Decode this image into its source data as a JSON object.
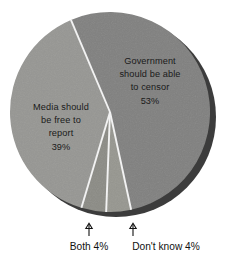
{
  "chart_data": {
    "type": "pie",
    "title": "",
    "subtitle": "",
    "xlabel": "",
    "ylabel": "",
    "legend_position": "none",
    "grid": false,
    "total": 100,
    "unit": "%",
    "categories": [
      "Government should be able to censor",
      "Don't know",
      "Both",
      "Media should be free to report"
    ],
    "values": [
      53,
      4,
      4,
      39
    ],
    "slices": [
      {
        "id": "government",
        "label_lines": [
          "Government",
          "should be able",
          "to censor"
        ],
        "value_label": "53%",
        "value": 53,
        "color": "#80807f",
        "start_angle_deg": -23,
        "end_angle_deg": 167.8,
        "label_placement": "inside",
        "label_x": 150,
        "label_y": 66
      },
      {
        "id": "dont-know",
        "label_lines": [
          "Don't know"
        ],
        "value_label": "4%",
        "value": 4,
        "color": "#96968f",
        "start_angle_deg": 167.8,
        "end_angle_deg": 182.2,
        "label_placement": "callout-bottom",
        "label_x": 167,
        "label_y": 246
      },
      {
        "id": "both",
        "label_lines": [
          "Both"
        ],
        "value_label": "4%",
        "value": 4,
        "color": "#8b8b85",
        "start_angle_deg": 182.2,
        "end_angle_deg": 196.6,
        "label_placement": "callout-bottom",
        "label_x": 89,
        "label_y": 246
      },
      {
        "id": "media",
        "label_lines": [
          "Media should",
          "be free to",
          "report"
        ],
        "value_label": "39%",
        "value": 39,
        "color": "#969693",
        "start_angle_deg": 196.6,
        "end_angle_deg": 337,
        "label_placement": "inside",
        "label_x": 62,
        "label_y": 112
      }
    ],
    "callouts": [
      {
        "id": "both-callout",
        "text": "Both 4%",
        "x": 89,
        "y": 246
      },
      {
        "id": "dont-know-callout",
        "text": "Don't know 4%",
        "x": 167,
        "y": 246
      }
    ],
    "geometry": {
      "center_x": 110,
      "center_y": 112,
      "radius": 100,
      "depth_offset_x": 6,
      "depth_offset_y": 5
    },
    "colors": {
      "slice_light": "#969693",
      "slice_dark": "#80807f",
      "shadow": "#3c3c3c",
      "divider": "#f2f2f2",
      "text": "#111111",
      "background": "#ffffff"
    }
  },
  "labels": {
    "government_line1": "Government",
    "government_line2": "should be able",
    "government_line3": "to censor",
    "government_value": "53%",
    "media_line1": "Media should",
    "media_line2": "be free to",
    "media_line3": "report",
    "media_value": "39%",
    "both_callout": "Both 4%",
    "dont_know_callout": "Don't know 4%"
  }
}
